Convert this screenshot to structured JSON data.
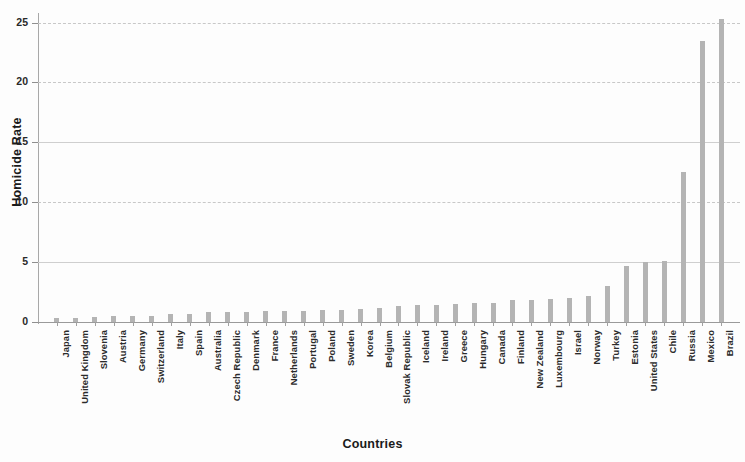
{
  "chart_data": {
    "type": "bar",
    "title": "",
    "xlabel": "Countries",
    "ylabel": "Homicide Rate",
    "ylim": [
      0,
      25.8
    ],
    "yticks": [
      0,
      5,
      10,
      15,
      20,
      25
    ],
    "ytick_labels": [
      "0",
      "5",
      "10",
      "15",
      "20",
      "25"
    ],
    "grid": true,
    "legend": null,
    "bar_color": "#b4b4b4",
    "categories": [
      "Japan",
      "United Kingdom",
      "Slovenia",
      "Austria",
      "Germany",
      "Switzerland",
      "Italy",
      "Spain",
      "Australia",
      "Czech Republic",
      "Denmark",
      "France",
      "Netherlands",
      "Portugal",
      "Poland",
      "Sweden",
      "Korea",
      "Belgium",
      "Slovak Republic",
      "Iceland",
      "Ireland",
      "Greece",
      "Hungary",
      "Canada",
      "Finland",
      "New Zealand",
      "Luxembourg",
      "Israel",
      "Norway",
      "Turkey",
      "Estonia",
      "United States",
      "Chile",
      "Russia",
      "Mexico",
      "Brazil"
    ],
    "values": [
      0.3,
      0.3,
      0.4,
      0.5,
      0.5,
      0.5,
      0.7,
      0.7,
      0.8,
      0.8,
      0.8,
      0.9,
      0.9,
      0.9,
      1.0,
      1.0,
      1.1,
      1.2,
      1.3,
      1.4,
      1.4,
      1.5,
      1.6,
      1.6,
      1.8,
      1.8,
      1.9,
      2.0,
      2.2,
      3.0,
      4.7,
      5.0,
      5.1,
      12.5,
      23.5,
      25.3
    ]
  }
}
